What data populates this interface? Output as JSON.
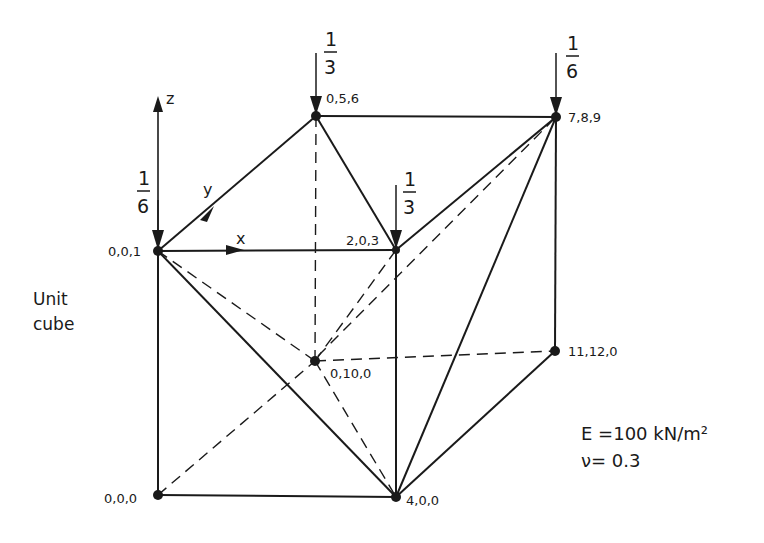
{
  "diagram": {
    "title": "Unit cube",
    "side_label": [
      "Unit",
      "cube"
    ],
    "axes": {
      "x": "x",
      "y": "y",
      "z": "z"
    },
    "properties": {
      "E": "E =100 kN/m²",
      "nu": "ν= 0.3"
    },
    "nodes": [
      {
        "id": "n001",
        "label": "0,0,1"
      },
      {
        "id": "n056",
        "label": "0,5,6"
      },
      {
        "id": "n789",
        "label": "7,8,9"
      },
      {
        "id": "n203",
        "label": "2,0,3"
      },
      {
        "id": "n0100",
        "label": "0,10,0"
      },
      {
        "id": "n11120",
        "label": "11,12,0"
      },
      {
        "id": "n000",
        "label": "0,0,0"
      },
      {
        "id": "n400",
        "label": "4,0,0"
      }
    ],
    "loads": [
      {
        "node": "0,0,1",
        "num": "1",
        "den": "6"
      },
      {
        "node": "0,5,6",
        "num": "1",
        "den": "3"
      },
      {
        "node": "2,0,3",
        "num": "1",
        "den": "3"
      },
      {
        "node": "7,8,9",
        "num": "1",
        "den": "6"
      }
    ],
    "edges_solid": [
      [
        "0,0,1",
        "0,5,6"
      ],
      [
        "0,0,1",
        "2,0,3"
      ],
      [
        "0,5,6",
        "7,8,9"
      ],
      [
        "0,5,6",
        "2,0,3"
      ],
      [
        "2,0,3",
        "7,8,9"
      ],
      [
        "0,0,1",
        "0,0,0"
      ],
      [
        "0,0,0",
        "4,0,0"
      ],
      [
        "2,0,3",
        "4,0,0"
      ],
      [
        "7,8,9",
        "4,0,0"
      ],
      [
        "7,8,9",
        "11,12,0"
      ],
      [
        "11,12,0",
        "4,0,0"
      ],
      [
        "0,0,1",
        "4,0,0"
      ]
    ],
    "edges_dashed": [
      [
        "0,5,6",
        "0,10,0"
      ],
      [
        "0,0,1",
        "0,10,0"
      ],
      [
        "0,10,0",
        "4,0,0"
      ],
      [
        "0,10,0",
        "11,12,0"
      ],
      [
        "0,0,0",
        "0,10,0"
      ],
      [
        "0,10,0",
        "2,0,3"
      ],
      [
        "0,10,0",
        "7,8,9"
      ]
    ]
  }
}
